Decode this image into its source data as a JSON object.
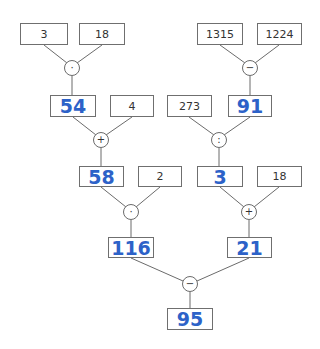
{
  "diagram": {
    "colors": {
      "result": "#2d62c8",
      "line": "#6b6b6b",
      "given": "#333333"
    },
    "left_branch": {
      "level1": {
        "a": "3",
        "b": "18",
        "op": "·",
        "result": "54"
      },
      "level2": {
        "b": "4",
        "op": "+",
        "result": "58"
      },
      "level3": {
        "b": "2",
        "op": "·",
        "result": "116"
      }
    },
    "right_branch": {
      "level1": {
        "a": "1315",
        "b": "1224",
        "op": "−",
        "result": "91"
      },
      "level2": {
        "a": "273",
        "op": ":",
        "result": "3"
      },
      "level3": {
        "b": "18",
        "op": "+",
        "result": "21"
      }
    },
    "final": {
      "op": "−",
      "result": "95"
    }
  }
}
